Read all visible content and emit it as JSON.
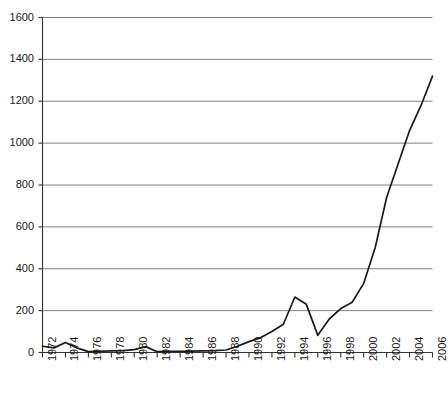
{
  "chart_data": {
    "type": "line",
    "title": "",
    "xlabel": "",
    "ylabel": "",
    "xlim": [
      1972,
      2006
    ],
    "ylim": [
      0,
      1600
    ],
    "grid": true,
    "legend": false,
    "legend_position": "none",
    "line_color": "#1a1a1a",
    "grid_color": "#808080",
    "axis_color": "#333333",
    "background_color": "#ffffff",
    "ytick_labels": [
      "1600",
      "1400",
      "1200",
      "1000",
      "800",
      "600",
      "400",
      "200",
      "0"
    ],
    "ytick_values": [
      1600,
      1400,
      1200,
      1000,
      800,
      600,
      400,
      200,
      0
    ],
    "xtick_labels": [
      "1972",
      "1974",
      "1976",
      "1978",
      "1980",
      "1982",
      "1984",
      "1986",
      "1988",
      "1990",
      "1992",
      "1994",
      "1996",
      "1998",
      "2000",
      "2002",
      "2004",
      "2006"
    ],
    "xtick_values": [
      1972,
      1974,
      1976,
      1978,
      1980,
      1982,
      1984,
      1986,
      1988,
      1990,
      1992,
      1994,
      1996,
      1998,
      2000,
      2002,
      2004,
      2006
    ],
    "x": [
      1972,
      1973,
      1974,
      1975,
      1976,
      1977,
      1978,
      1979,
      1980,
      1981,
      1982,
      1983,
      1984,
      1985,
      1986,
      1987,
      1988,
      1989,
      1990,
      1991,
      1992,
      1993,
      1994,
      1995,
      1996,
      1997,
      1998,
      1999,
      2000,
      2001,
      2002,
      2003,
      2004,
      2005,
      2006
    ],
    "values": [
      30,
      22,
      48,
      22,
      4,
      6,
      8,
      9,
      14,
      28,
      4,
      5,
      6,
      7,
      8,
      9,
      12,
      30,
      52,
      70,
      100,
      135,
      265,
      230,
      82,
      160,
      210,
      240,
      330,
      500,
      740,
      900,
      1060,
      1180,
      1320
    ]
  }
}
